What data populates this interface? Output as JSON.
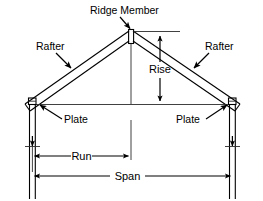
{
  "diagram": {
    "background_color": "#ffffff",
    "line_color": "#000000",
    "labels": {
      "ridge_member": "Ridge Member",
      "rafter_left": "Rafter",
      "rafter_right": "Rafter",
      "rise": "Rise",
      "plate_left": "Plate",
      "plate_right": "Plate",
      "run": "Run",
      "span": "Span"
    },
    "components": [
      {
        "name": "ridge-member",
        "label": "Ridge Member"
      },
      {
        "name": "rafter-left",
        "label": "Rafter"
      },
      {
        "name": "rafter-right",
        "label": "Rafter"
      },
      {
        "name": "plate-left",
        "label": "Plate"
      },
      {
        "name": "plate-right",
        "label": "Plate"
      },
      {
        "name": "wall-stud-left",
        "label": ""
      },
      {
        "name": "wall-stud-right",
        "label": ""
      },
      {
        "name": "ceiling-tie",
        "label": ""
      }
    ],
    "dimensions": [
      {
        "name": "rise",
        "label": "Rise",
        "orientation": "vertical"
      },
      {
        "name": "run",
        "label": "Run",
        "orientation": "horizontal"
      },
      {
        "name": "span",
        "label": "Span",
        "orientation": "horizontal"
      }
    ]
  }
}
